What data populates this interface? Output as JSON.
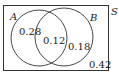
{
  "diagram": {
    "type": "venn",
    "universe_label": "S",
    "sets": [
      {
        "label": "A",
        "only_value": "0.28"
      },
      {
        "label": "B",
        "only_value": "0.18"
      }
    ],
    "intersection_value": "0.12",
    "outside_value": "0.42",
    "colors": {
      "stroke": "#333333",
      "text": "#1a1a1a",
      "background": "#ffffff"
    }
  }
}
